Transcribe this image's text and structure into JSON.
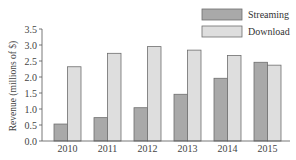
{
  "chart_data": {
    "type": "bar",
    "title": "",
    "xlabel": "",
    "ylabel": "Revenue (millions of $)",
    "ylim": [
      0,
      3.5
    ],
    "yticks": [
      "0.0",
      "0.5",
      "1.0",
      "1.5",
      "2.0",
      "2.5",
      "3.0",
      "3.5"
    ],
    "categories": [
      "2010",
      "2011",
      "2012",
      "2013",
      "2014",
      "2015"
    ],
    "series": [
      {
        "name": "Streaming",
        "color": "#a9a9a9",
        "values": [
          0.53,
          0.73,
          1.04,
          1.46,
          1.96,
          2.46
        ]
      },
      {
        "name": "Download",
        "color": "#dedede",
        "values": [
          2.32,
          2.74,
          2.95,
          2.84,
          2.67,
          2.37
        ]
      }
    ],
    "grid": false,
    "legend_position": "upper right"
  },
  "legend": {
    "items": [
      {
        "label": "Streaming"
      },
      {
        "label": "Download"
      }
    ]
  }
}
